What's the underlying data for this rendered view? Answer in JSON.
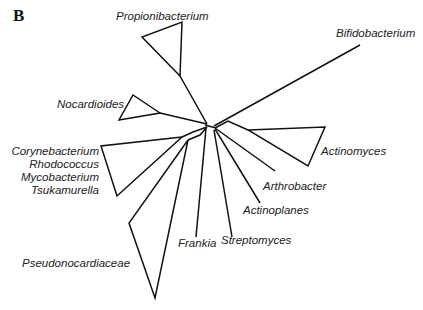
{
  "panel_label": "B",
  "diagram_type": "unrooted phylogenetic tree",
  "taxa": [
    {
      "name": "Propionibacterium",
      "shape": "collapsed-clade"
    },
    {
      "name": "Bifidobacterium",
      "shape": "single-branch"
    },
    {
      "name": "Nocardioides",
      "shape": "collapsed-clade"
    },
    {
      "name": "Corynebacterium",
      "shape": "collapsed-clade"
    },
    {
      "name": "Rhodococcus",
      "shape": "collapsed-clade"
    },
    {
      "name": "Mycobacterium",
      "shape": "collapsed-clade"
    },
    {
      "name": "Tsukamurella",
      "shape": "collapsed-clade"
    },
    {
      "name": "Actinomyces",
      "shape": "collapsed-clade"
    },
    {
      "name": "Arthrobacter",
      "shape": "single-branch"
    },
    {
      "name": "Actinoplanes",
      "shape": "single-branch"
    },
    {
      "name": "Frankia",
      "shape": "single-branch"
    },
    {
      "name": "Streptomyces",
      "shape": "single-branch"
    },
    {
      "name": "Pseudonocardiaceae",
      "shape": "collapsed-clade"
    }
  ],
  "colors": {
    "line": "#111111",
    "text": "#222222",
    "background": "#ffffff"
  }
}
